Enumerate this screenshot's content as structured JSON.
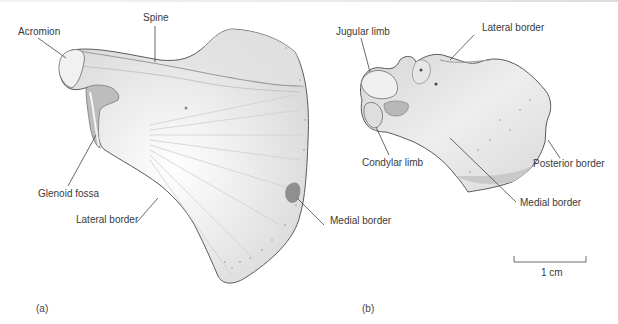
{
  "figure": {
    "panels": [
      {
        "id": "a",
        "label": "(a)",
        "annotations": [
          {
            "text": "Acromion"
          },
          {
            "text": "Spine"
          },
          {
            "text": "Glenoid fossa"
          },
          {
            "text": "Lateral border"
          },
          {
            "text": "Medial border"
          }
        ]
      },
      {
        "id": "b",
        "label": "(b)",
        "annotations": [
          {
            "text": "Jugular limb"
          },
          {
            "text": "Lateral border"
          },
          {
            "text": "Condylar limb"
          },
          {
            "text": "Posterior border"
          },
          {
            "text": "Medial border"
          }
        ]
      }
    ],
    "scale_bar": {
      "label": "1 cm"
    }
  },
  "colors": {
    "label_text": "#3a3a3a",
    "leader_line": "#444444",
    "bone_outline": "#555555",
    "bone_fill": "#e9e9e9"
  }
}
